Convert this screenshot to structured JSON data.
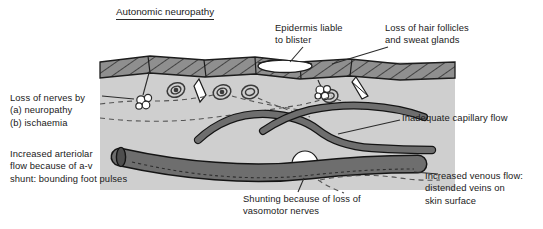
{
  "figure": {
    "title": "Autonomic neuropathy",
    "type": "medical-cross-section-diagram",
    "width": 543,
    "height": 229
  },
  "colors": {
    "page_background": "#ffffff",
    "dermis_panel": "#cfcfcf",
    "epidermis_fill": "#8f8f8f",
    "epidermis_stroke": "#1c1c1c",
    "vessel_fill": "#6e6e6e",
    "vessel_stroke": "#141414",
    "blister_fill": "#ffffff",
    "shunt_fill": "#ffffff",
    "text": "#1a1a1a",
    "leader_line": "#2b2b2b",
    "nerve_dashed": "#555555"
  },
  "labels": {
    "loss_of_nerves": "Loss of nerves by\n(a) neuropathy\n(b) ischaemia",
    "epidermis_blister": "Epidermis liable\nto blister",
    "loss_of_follicles": "Loss of hair follicles\nand sweat glands",
    "inadequate_capillary": "Inadequate capillary flow",
    "increased_arteriolar": "Increased arteriolar\nflow because of a-v\nshunt: bounding foot pulses",
    "shunting": "Shunting because of loss of\nvasomotor nerves",
    "increased_venous": "Increased venous flow:\ndistended veins on\nskin surface"
  },
  "structures": [
    {
      "name": "epidermis",
      "description": "hatched surface band across the top of the section"
    },
    {
      "name": "blister",
      "description": "white lens-shaped cavity within the epidermis"
    },
    {
      "name": "sweat-gland",
      "description": "coiled spiral glands in the dermis",
      "count": 4
    },
    {
      "name": "hair-follicle",
      "description": "white elongated diamond follicles in the dermis",
      "count": 2
    },
    {
      "name": "nerve-cluster",
      "description": "small lobed nerve bundles",
      "count": 2
    },
    {
      "name": "capillary",
      "description": "narrow superficial looping vessel"
    },
    {
      "name": "arteriole",
      "description": "large vessel entering from the left"
    },
    {
      "name": "vein",
      "description": "large distended vessel leaving to the right"
    },
    {
      "name": "av-shunt",
      "description": "white circular arteriovenous shunt crossing the large vessel"
    }
  ]
}
